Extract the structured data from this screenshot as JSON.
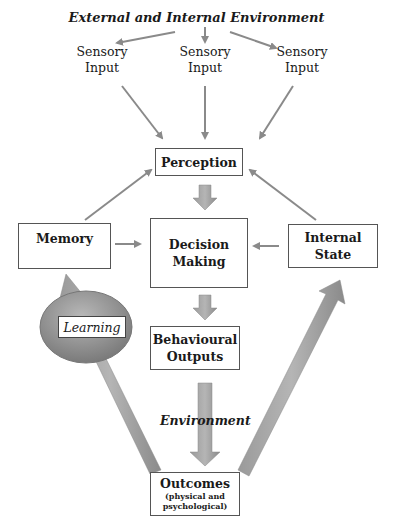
{
  "diagram": {
    "title": "External and Internal Environment",
    "sensory_inputs": [
      {
        "line1": "Sensory",
        "line2": "Input"
      },
      {
        "line1": "Sensory",
        "line2": "Input"
      },
      {
        "line1": "Sensory",
        "line2": "Input"
      }
    ],
    "nodes": {
      "perception": "Perception",
      "memory": "Memory",
      "decision_line1": "Decision",
      "decision_line2": "Making",
      "internal_line1": "Internal",
      "internal_line2": "State",
      "behaviour_line1": "Behavioural",
      "behaviour_line2": "Outputs",
      "outcomes": "Outcomes",
      "outcomes_sub1": "(physical and",
      "outcomes_sub2": "psychological)"
    },
    "labels": {
      "learning": "Learning",
      "environment": "Environment"
    },
    "edges": [
      {
        "from": "External and Internal Environment",
        "to": "Sensory Input (left)"
      },
      {
        "from": "External and Internal Environment",
        "to": "Sensory Input (center)"
      },
      {
        "from": "External and Internal Environment",
        "to": "Sensory Input (right)"
      },
      {
        "from": "Sensory Input (left)",
        "to": "Perception"
      },
      {
        "from": "Sensory Input (center)",
        "to": "Perception"
      },
      {
        "from": "Sensory Input (right)",
        "to": "Perception"
      },
      {
        "from": "Memory",
        "to": "Perception"
      },
      {
        "from": "Internal State",
        "to": "Perception"
      },
      {
        "from": "Perception",
        "to": "Decision Making"
      },
      {
        "from": "Memory",
        "to": "Decision Making"
      },
      {
        "from": "Internal State",
        "to": "Decision Making"
      },
      {
        "from": "Decision Making",
        "to": "Behavioural Outputs"
      },
      {
        "from": "Behavioural Outputs",
        "to": "Outcomes",
        "label": "Environment"
      },
      {
        "from": "Outcomes",
        "to": "Memory",
        "label": "Learning"
      },
      {
        "from": "Outcomes",
        "to": "Internal State"
      }
    ],
    "colors": {
      "arrow": "#8a8a8a",
      "ellipse": "#8c8c8c",
      "box_border": "#555555"
    }
  }
}
